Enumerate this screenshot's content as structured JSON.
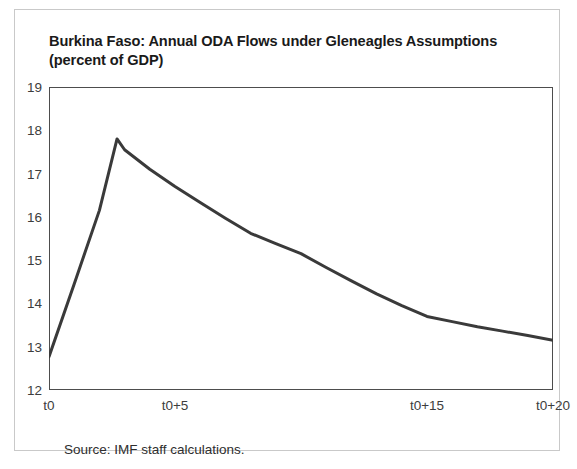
{
  "figure": {
    "title_line1": "Burkina Faso: Annual ODA Flows under Gleneagles Assumptions",
    "title_line2": "(percent of GDP)",
    "source_note": "Source: IMF staff calculations."
  },
  "chart_data": {
    "type": "line",
    "title": "Burkina Faso: Annual ODA Flows under Gleneagles Assumptions (percent of GDP)",
    "xlabel": "",
    "ylabel": "",
    "ylim": [
      12,
      19
    ],
    "xlim": [
      0,
      20
    ],
    "grid": false,
    "legend": null,
    "line_color": "#3a3a3a",
    "line_width": 3,
    "yticks": [
      12,
      13,
      14,
      15,
      16,
      17,
      18,
      19
    ],
    "ytick_labels": [
      "12",
      "13",
      "14",
      "15",
      "16",
      "17",
      "18",
      "19"
    ],
    "xticks": [
      0,
      5,
      15,
      20
    ],
    "xtick_labels": [
      "t0",
      "t0+5",
      "t0+15",
      "t0+20"
    ],
    "x": [
      0,
      1,
      2,
      2.7,
      3,
      4,
      5,
      6,
      7,
      8,
      9,
      10,
      11,
      12,
      13,
      14,
      15,
      16,
      17,
      18,
      19,
      20
    ],
    "y": [
      12.77,
      14.45,
      16.15,
      17.8,
      17.55,
      17.1,
      16.7,
      16.33,
      15.97,
      15.62,
      15.38,
      15.15,
      14.83,
      14.52,
      14.22,
      13.95,
      13.7,
      13.58,
      13.46,
      13.36,
      13.26,
      13.15
    ],
    "series": [
      {
        "name": "Annual ODA flows (percent of GDP)",
        "values": [
          12.77,
          14.45,
          16.15,
          17.8,
          17.55,
          17.1,
          16.7,
          16.33,
          15.97,
          15.62,
          15.38,
          15.15,
          14.83,
          14.52,
          14.22,
          13.95,
          13.7,
          13.58,
          13.46,
          13.36,
          13.26,
          13.15
        ]
      }
    ],
    "annotations": {
      "peak_value": 17.8,
      "peak_x": 2.7,
      "start_value": 12.77,
      "end_value": 13.15
    }
  }
}
